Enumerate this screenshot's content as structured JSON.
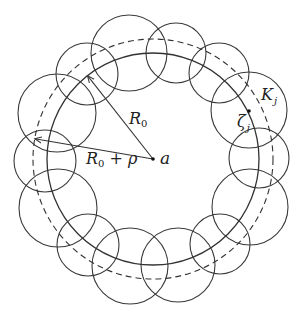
{
  "figure": {
    "stroke_color": "#333333",
    "center": {
      "x": 153,
      "y": 159,
      "label": "a"
    },
    "solid_circle": {
      "r": 106,
      "label": "R0"
    },
    "dashed_circle": {
      "r": 120,
      "label": "R0 + ρ"
    },
    "small_circles": [
      {
        "cx": 129,
        "cy": 53,
        "r": 38
      },
      {
        "cx": 176,
        "cy": 53,
        "r": 30
      },
      {
        "cx": 219,
        "cy": 73,
        "r": 30
      },
      {
        "cx": 249,
        "cy": 110,
        "r": 38,
        "label": "K_j"
      },
      {
        "cx": 259,
        "cy": 158,
        "r": 30
      },
      {
        "cx": 250,
        "cy": 207,
        "r": 38
      },
      {
        "cx": 220,
        "cy": 244,
        "r": 30
      },
      {
        "cx": 178,
        "cy": 265,
        "r": 37
      },
      {
        "cx": 130,
        "cy": 266,
        "r": 38
      },
      {
        "cx": 88,
        "cy": 245,
        "r": 31
      },
      {
        "cx": 58,
        "cy": 208,
        "r": 39
      },
      {
        "cx": 45,
        "cy": 161,
        "r": 31
      },
      {
        "cx": 57,
        "cy": 113,
        "r": 39
      },
      {
        "cx": 87,
        "cy": 74,
        "r": 31
      }
    ],
    "point_zeta": {
      "x": 249,
      "y": 111
    }
  },
  "labels": {
    "center": "a",
    "r0_main": "R",
    "r0_sub": "0",
    "r0rho_main": "R",
    "r0rho_sub": "0",
    "r0rho_op": " + ",
    "r0rho_rho": "ρ",
    "k_main": "K",
    "k_sub": "j",
    "zeta_main": "ζ",
    "zeta_sub": "j"
  }
}
